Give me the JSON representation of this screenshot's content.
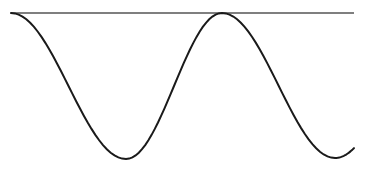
{
  "diagram": {
    "type": "wave-sketch",
    "colors": {
      "background": "#ffffff",
      "reference_line": "#555555",
      "wave": "#1a1a1a"
    },
    "reference_line": {
      "x1": 11,
      "y1": 13,
      "x2": 354,
      "y2": 13
    },
    "wave_points": [
      {
        "x": 11,
        "y": 13,
        "label": "start (touches line)"
      },
      {
        "x": 126,
        "y": 159,
        "label": "trough 1"
      },
      {
        "x": 222,
        "y": 13,
        "label": "crest (touches line)"
      },
      {
        "x": 335,
        "y": 158,
        "label": "trough 2"
      },
      {
        "x": 354,
        "y": 152,
        "label": "end"
      }
    ]
  }
}
